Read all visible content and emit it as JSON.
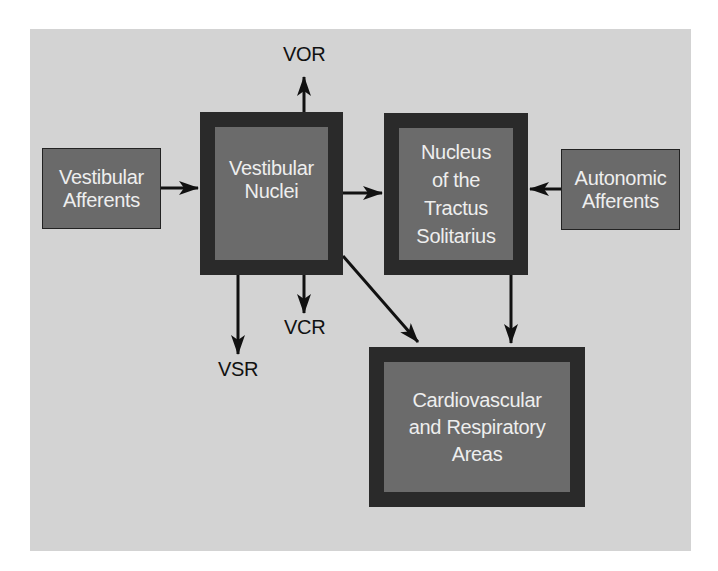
{
  "diagram": {
    "colors": {
      "background_panel": "#d3d3d3",
      "box_fill": "#6b6b6b",
      "box_border_thick": "#2a2a2a",
      "text_on_box": "#eeeeee",
      "arrow": "#111111"
    },
    "nodes": {
      "vestibular_afferents": {
        "line1": "Vestibular",
        "line2": "Afferents"
      },
      "vestibular_nuclei": {
        "line1": "Vestibular",
        "line2": "Nuclei"
      },
      "nts": {
        "line1": "Nucleus",
        "line2": "of the",
        "line3": "Tractus",
        "line4": "Solitarius"
      },
      "autonomic_afferents": {
        "line1": "Autonomic",
        "line2": "Afferents"
      },
      "cardio_resp": {
        "line1": "Cardiovascular",
        "line2": "and Respiratory",
        "line3": "Areas"
      }
    },
    "outputs": {
      "vor": "VOR",
      "vcr": "VCR",
      "vsr": "VSR"
    },
    "edges": [
      {
        "from": "Vestibular Afferents",
        "to": "Vestibular Nuclei"
      },
      {
        "from": "Vestibular Nuclei",
        "to": "VOR"
      },
      {
        "from": "Vestibular Nuclei",
        "to": "Nucleus of the Tractus Solitarius"
      },
      {
        "from": "Autonomic Afferents",
        "to": "Nucleus of the Tractus Solitarius"
      },
      {
        "from": "Vestibular Nuclei",
        "to": "VSR"
      },
      {
        "from": "Vestibular Nuclei",
        "to": "VCR"
      },
      {
        "from": "Vestibular Nuclei",
        "to": "Cardiovascular and Respiratory Areas"
      },
      {
        "from": "Nucleus of the Tractus Solitarius",
        "to": "Cardiovascular and Respiratory Areas"
      }
    ]
  }
}
